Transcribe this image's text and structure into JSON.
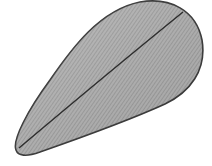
{
  "figure": {
    "colors": {
      "background": "#ffffff",
      "fill_light": "#bdbdbd",
      "fill_dark": "#9a9a9a",
      "outline": "#3a3a3a",
      "hatch": "#8a8a8a"
    }
  }
}
